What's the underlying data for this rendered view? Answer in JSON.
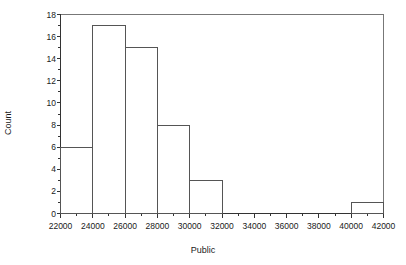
{
  "chart_data": {
    "type": "bar",
    "title": "",
    "subtitle": "",
    "xlabel": "Public",
    "ylabel": "Count",
    "xlim": [
      22000,
      42000
    ],
    "ylim": [
      0,
      18
    ],
    "grid": false,
    "legend": null,
    "bin_width": 2000,
    "categories": [
      "22000-24000",
      "24000-26000",
      "26000-28000",
      "28000-30000",
      "30000-32000",
      "32000-34000",
      "34000-36000",
      "36000-38000",
      "38000-40000",
      "40000-42000"
    ],
    "bin_edges": [
      22000,
      24000,
      26000,
      28000,
      30000,
      32000,
      34000,
      36000,
      38000,
      40000,
      42000
    ],
    "values": [
      6,
      17,
      15,
      8,
      3,
      0,
      0,
      0,
      0,
      1
    ],
    "xticks": [
      22000,
      24000,
      26000,
      28000,
      30000,
      32000,
      34000,
      36000,
      38000,
      40000,
      42000
    ],
    "xtick_labels": [
      "22000",
      "24000",
      "26000",
      "28000",
      "30000",
      "32000",
      "34000",
      "36000",
      "38000",
      "40000",
      "42000"
    ],
    "x_minor_ticks": [
      23000,
      25000,
      27000,
      29000,
      31000,
      33000,
      35000,
      37000,
      39000,
      41000
    ],
    "yticks": [
      0,
      2,
      4,
      6,
      8,
      10,
      12,
      14,
      16,
      18
    ],
    "ytick_labels": [
      "0",
      "2",
      "4",
      "6",
      "8",
      "10",
      "12",
      "14",
      "16",
      "18"
    ],
    "y_minor_ticks": [
      1,
      3,
      5,
      7,
      9,
      11,
      13,
      15,
      17
    ],
    "colors": {
      "background": "#ffffff",
      "bar_fill": "none",
      "bar_edge": "#555555",
      "axis": "#333333",
      "frame": "#777777",
      "text": "#1a1a1a"
    }
  }
}
